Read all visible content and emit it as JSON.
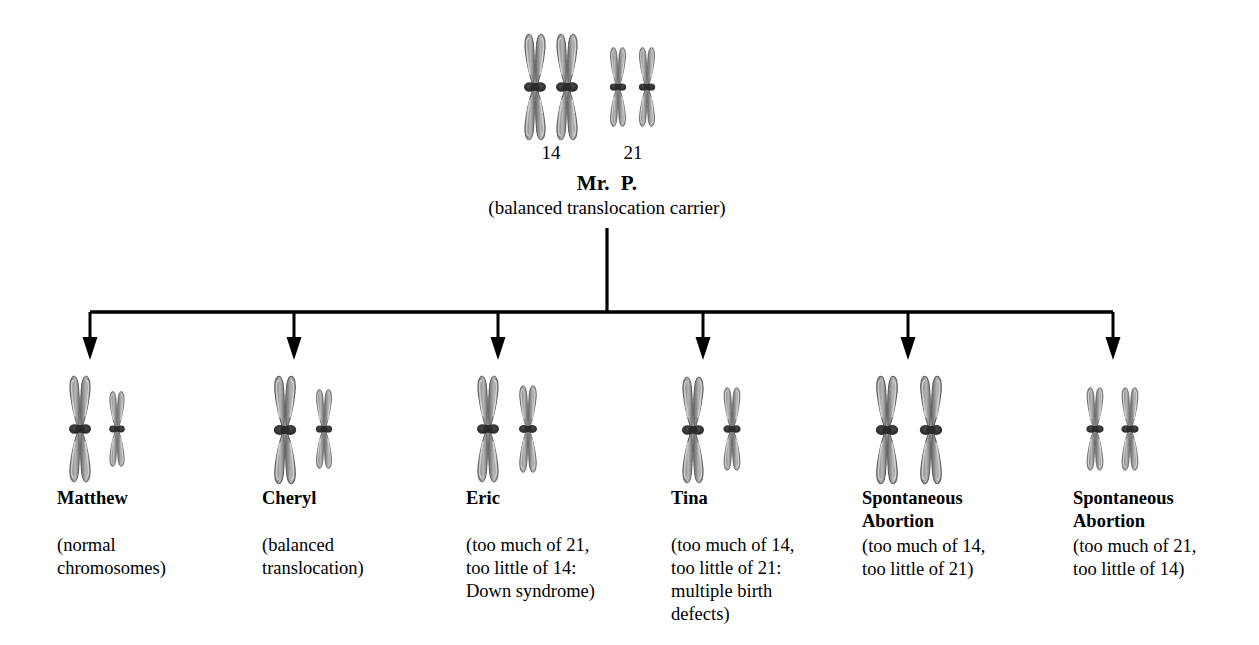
{
  "diagram": {
    "title_parent": "Mr.  P.",
    "parent_subtitle": "(balanced translocation carrier)",
    "chromosome_numbers": [
      {
        "value": "14"
      },
      {
        "value": "21"
      }
    ],
    "colors": {
      "chromosome_fill": "#8c8c8c",
      "chromosome_fill_light": "#a8a8a8",
      "chromosome_outline": "#4a4a4a",
      "centromere": "#2a2a2a",
      "line": "#000000",
      "background": "#ffffff"
    },
    "children": [
      {
        "name": "Matthew",
        "description": "(normal\nchromosomes)",
        "karyotype": "one large chromosome 14, one small chromosome 21"
      },
      {
        "name": "Cheryl",
        "description": "(balanced\ntranslocation)",
        "karyotype": "one large translocated chromosome, one small chromosome 21"
      },
      {
        "name": "Eric",
        "description": "(too much of 21,\ntoo little of 14:\nDown syndrome)",
        "karyotype": "one long chromosome, one medium chromosome"
      },
      {
        "name": "Tina",
        "description": "(too much of 14,\ntoo little of 21:\nmultiple birth\ndefects)",
        "karyotype": "one large chromosome, one small chromosome"
      },
      {
        "name": "Spontaneous\nAbortion",
        "description": "(too much of 14,\ntoo little of 21)",
        "karyotype": "two large chromosomes"
      },
      {
        "name": "Spontaneous\nAbortion",
        "description": "(too much of 21,\ntoo little of 14)",
        "karyotype": "two small chromosomes"
      }
    ]
  }
}
